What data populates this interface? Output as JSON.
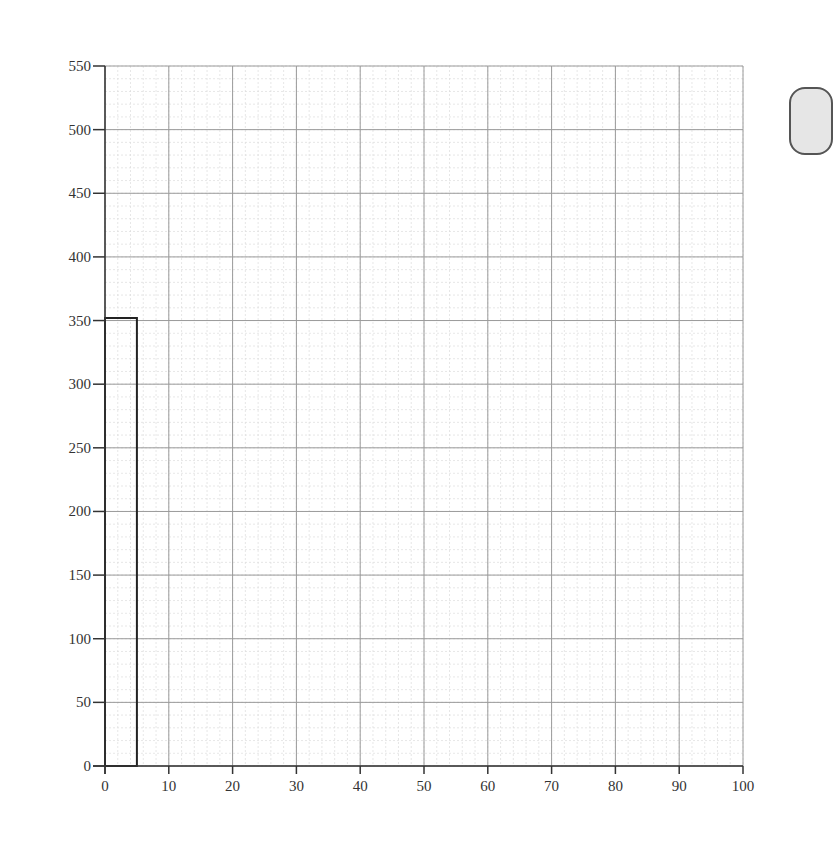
{
  "chart_data": {
    "type": "bar",
    "subtype": "histogram",
    "title": "",
    "xlabel": "",
    "ylabel": "",
    "xlim": [
      0,
      100
    ],
    "ylim": [
      0,
      550
    ],
    "grid": {
      "major": true,
      "minor": true
    },
    "x_ticks": [
      0,
      10,
      20,
      30,
      40,
      50,
      60,
      70,
      80,
      90,
      100
    ],
    "y_ticks": [
      0,
      50,
      100,
      150,
      200,
      250,
      300,
      350,
      400,
      450,
      500,
      550
    ],
    "bins": [
      {
        "x0": 0,
        "x1": 5,
        "value": 352
      }
    ],
    "categories": [
      "0-5"
    ],
    "values": [
      352
    ],
    "legend": null
  },
  "colors": {
    "bar_stroke": "#222222",
    "bar_fill": "#ffffff",
    "major_grid": "#9a9a9a",
    "minor_grid": "#dcdcdc",
    "axis": "#333333",
    "note_box_fill": "#e6e6e6"
  }
}
